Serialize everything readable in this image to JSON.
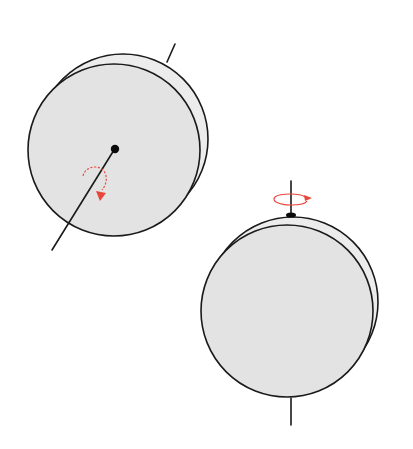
{
  "figure": {
    "background": "#ffffff",
    "disk_fill": "#e3e3e3",
    "rim_fill": "#ececec",
    "outline_color": "#1a1a1a",
    "arrow_color": "#e8463a"
  },
  "panels": [
    {
      "id": "disk-1",
      "view": "face-on tilted disk, axle through center pointing toward lower-left",
      "rotation_arrow": "curved arrow around the axle, clockwise"
    },
    {
      "id": "disk-2",
      "view": "disk with vertical axle through top and bottom edge",
      "rotation_arrow": "horizontal loop around the axle at top"
    }
  ]
}
